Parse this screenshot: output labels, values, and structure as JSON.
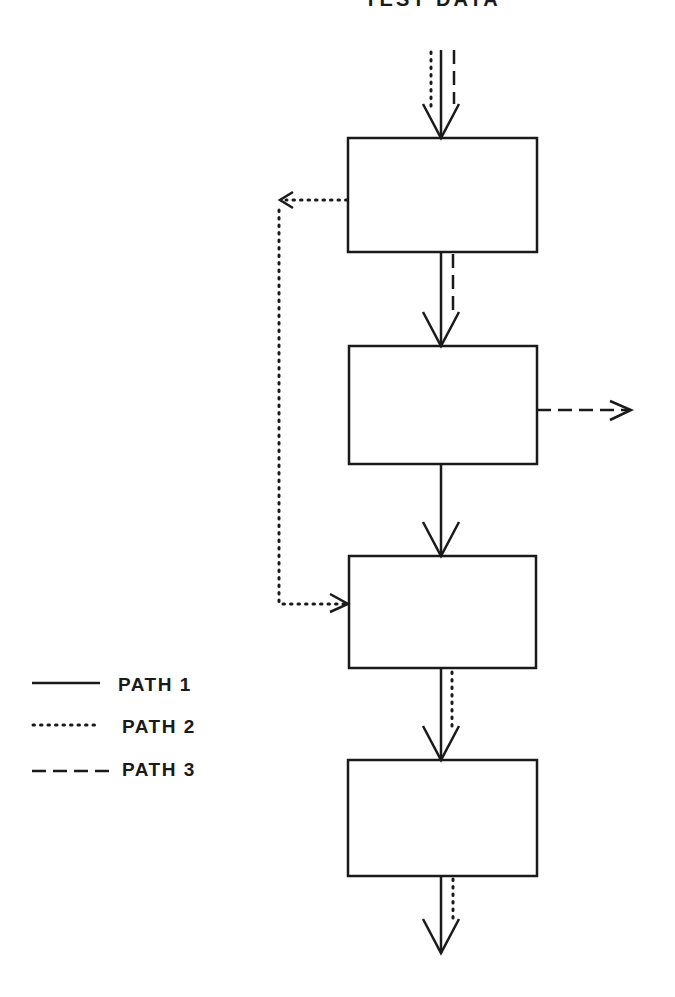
{
  "diagram": {
    "title": "TEST DATA",
    "blocks": [
      {
        "id": "block-1",
        "x": 348,
        "y": 138,
        "w": 189,
        "h": 114
      },
      {
        "id": "block-2",
        "x": 349,
        "y": 346,
        "w": 188,
        "h": 118
      },
      {
        "id": "block-3",
        "x": 349,
        "y": 556,
        "w": 187,
        "h": 112
      },
      {
        "id": "block-4",
        "x": 348,
        "y": 760,
        "w": 189,
        "h": 116
      }
    ],
    "legend": [
      {
        "style": "solid",
        "label": "PATH 1"
      },
      {
        "style": "dotted",
        "label": "PATH 2"
      },
      {
        "style": "dashed",
        "label": "PATH 3"
      }
    ],
    "colors": {
      "line": "#1a1a1a",
      "background": "#ffffff"
    }
  }
}
